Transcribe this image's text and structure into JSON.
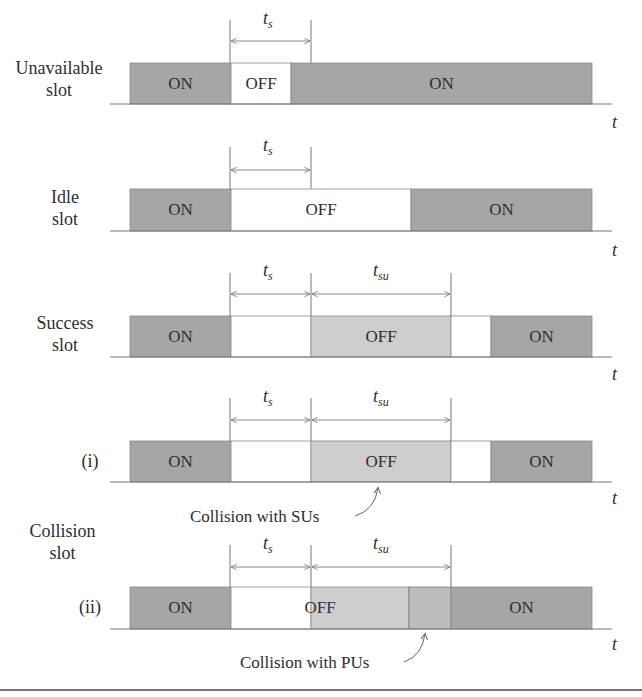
{
  "colors": {
    "on_fill": "#a6a6a6",
    "off_light_fill": "#cecece",
    "overlap_fill": "#bcbcbc",
    "idle_fill": "#ffffff",
    "line": "#6a6a6a",
    "text": "#2e2e2e"
  },
  "axis_symbol": "t",
  "durations": {
    "ts": {
      "base": "t",
      "sub": "s"
    },
    "tsu": {
      "base": "t",
      "sub": "su"
    }
  },
  "rows": [
    {
      "id": "unavailable",
      "label_line1": "Unavailable",
      "label_line2": "slot",
      "segments": [
        {
          "state": "ON",
          "label": "ON",
          "x0": 130,
          "x1": 231
        },
        {
          "state": "OFF",
          "label": "OFF",
          "x0": 231,
          "x1": 291
        },
        {
          "state": "ON",
          "label": "ON",
          "x0": 291,
          "x1": 592
        }
      ],
      "markers": [
        "ts"
      ]
    },
    {
      "id": "idle",
      "label_line1": "Idle",
      "label_line2": "slot",
      "segments": [
        {
          "state": "ON",
          "label": "ON",
          "x0": 130,
          "x1": 231
        },
        {
          "state": "OFF",
          "label": "OFF",
          "x0": 231,
          "x1": 411
        },
        {
          "state": "ON",
          "label": "ON",
          "x0": 411,
          "x1": 592
        }
      ],
      "markers": [
        "ts"
      ]
    },
    {
      "id": "success",
      "label_line1": "Success",
      "label_line2": "slot",
      "segments": [
        {
          "state": "ON",
          "label": "ON",
          "x0": 130,
          "x1": 231
        },
        {
          "state": "IDLE",
          "label": "",
          "x0": 231,
          "x1": 311
        },
        {
          "state": "OFF",
          "label": "OFF",
          "x0": 311,
          "x1": 451
        },
        {
          "state": "IDLE",
          "label": "",
          "x0": 451,
          "x1": 491
        },
        {
          "state": "ON",
          "label": "ON",
          "x0": 491,
          "x1": 592
        }
      ],
      "markers": [
        "ts",
        "tsu"
      ]
    },
    {
      "id": "collision_i",
      "label_line1": "(i)",
      "segments": [
        {
          "state": "ON",
          "label": "ON",
          "x0": 130,
          "x1": 231
        },
        {
          "state": "IDLE",
          "label": "",
          "x0": 231,
          "x1": 311
        },
        {
          "state": "OFF",
          "label": "OFF",
          "x0": 311,
          "x1": 451
        },
        {
          "state": "IDLE",
          "label": "",
          "x0": 451,
          "x1": 491
        },
        {
          "state": "ON",
          "label": "ON",
          "x0": 491,
          "x1": 592
        }
      ],
      "markers": [
        "ts",
        "tsu"
      ],
      "annotation": "Collision with SUs"
    },
    {
      "id": "collision_ii",
      "label_line1": "(ii)",
      "segments": [
        {
          "state": "ON",
          "label": "ON",
          "x0": 130,
          "x1": 231
        },
        {
          "state": "IDLE",
          "label": "",
          "x0": 231,
          "x1": 311
        },
        {
          "state": "OFF",
          "label": "",
          "x0": 311,
          "x1": 409
        },
        {
          "state": "OVERLAP",
          "label": "",
          "x0": 409,
          "x1": 451
        },
        {
          "state": "ON",
          "label": "ON",
          "x0": 451,
          "x1": 592
        }
      ],
      "off_label": "OFF",
      "markers": [
        "ts",
        "tsu"
      ],
      "annotation": "Collision with PUs"
    }
  ],
  "group_label": {
    "line1": "Collision",
    "line2": "slot"
  }
}
